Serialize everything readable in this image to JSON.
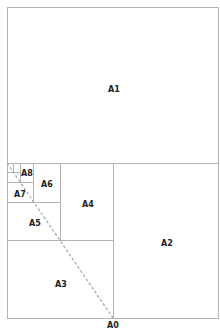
{
  "diagram": {
    "sheets": [
      {
        "id": "A1",
        "label": "A1"
      },
      {
        "id": "A2",
        "label": "A2"
      },
      {
        "id": "A3",
        "label": "A3"
      },
      {
        "id": "A4",
        "label": "A4"
      },
      {
        "id": "A5",
        "label": "A5"
      },
      {
        "id": "A6",
        "label": "A6"
      },
      {
        "id": "A7",
        "label": "A7"
      },
      {
        "id": "A8",
        "label": "A8"
      }
    ],
    "outer_label": "A0",
    "colors": {
      "border": "#b4b4b4",
      "diagonal": "#a8a8a8",
      "text": "#222222"
    }
  }
}
